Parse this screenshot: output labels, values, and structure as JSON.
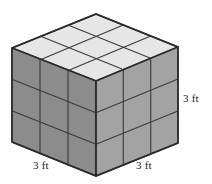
{
  "figure": {
    "name": "cube-diagram",
    "shape": "cube",
    "subdivisions": {
      "rows": 3,
      "columns": 3,
      "layers": 3
    },
    "unit": "ft",
    "edge_length": 3
  },
  "labels": {
    "right": "3 ft",
    "bottom_left": "3 ft",
    "bottom_right": "3 ft"
  },
  "colors": {
    "background": "#ffffff",
    "top_face": "#e6e6e6",
    "left_face": "#8c8c8c",
    "right_face": "#a3a3a3",
    "outline": "#2b2b2b",
    "gridline": "#3a3a3a",
    "text": "#1a1a1a"
  },
  "geometry": {
    "top_vertex": [
      96,
      14
    ],
    "left_vertex": [
      12,
      48
    ],
    "right_vertex": [
      178,
      47
    ],
    "front_top_vertex": [
      96,
      81
    ],
    "bottom_left_vertex": [
      12,
      142
    ],
    "front_bottom_vertex": [
      96,
      176
    ],
    "bottom_right_vertex": [
      178,
      143
    ]
  }
}
